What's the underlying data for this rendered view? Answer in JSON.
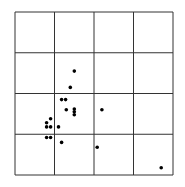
{
  "chart_data": {
    "type": "scatter",
    "title": "",
    "xlabel": "",
    "ylabel": "",
    "grid": true,
    "grid_divisions": 4,
    "legend": null,
    "xlim": [
      0,
      4
    ],
    "ylim": [
      0,
      4
    ],
    "points": [
      {
        "x": 1.5,
        "y": 2.55
      },
      {
        "x": 1.4,
        "y": 2.15
      },
      {
        "x": 1.18,
        "y": 1.85
      },
      {
        "x": 1.28,
        "y": 1.85
      },
      {
        "x": 1.3,
        "y": 1.6
      },
      {
        "x": 1.5,
        "y": 1.62
      },
      {
        "x": 1.5,
        "y": 1.55
      },
      {
        "x": 1.5,
        "y": 1.48
      },
      {
        "x": 2.2,
        "y": 1.6
      },
      {
        "x": 0.9,
        "y": 1.38
      },
      {
        "x": 0.8,
        "y": 1.28
      },
      {
        "x": 0.8,
        "y": 1.18
      },
      {
        "x": 0.9,
        "y": 1.18
      },
      {
        "x": 1.1,
        "y": 1.18
      },
      {
        "x": 0.8,
        "y": 0.92
      },
      {
        "x": 0.9,
        "y": 0.92
      },
      {
        "x": 1.18,
        "y": 0.8
      },
      {
        "x": 2.08,
        "y": 0.68
      },
      {
        "x": 3.7,
        "y": 0.18
      }
    ]
  },
  "style": {
    "grid_color": "#333333",
    "point_color": "#000000",
    "background": "#ffffff"
  },
  "layout": {
    "plot_left": 15,
    "plot_top": 12,
    "plot_right": 173,
    "plot_bottom": 175,
    "point_radius": 1.8
  }
}
